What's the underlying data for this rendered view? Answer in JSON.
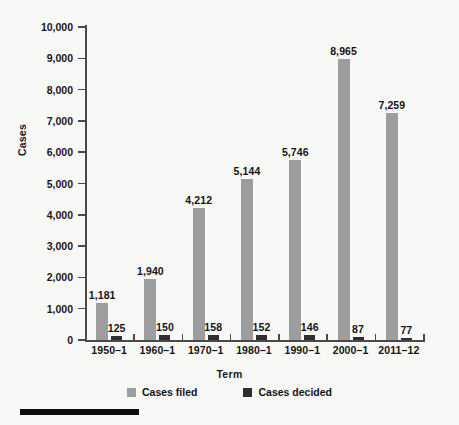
{
  "chart_data": {
    "type": "bar",
    "title": "",
    "xlabel": "Term",
    "ylabel": "Cases",
    "ylim": [
      0,
      10000
    ],
    "ytick_labels": [
      "10,000",
      "9,000",
      "8,000",
      "7,000",
      "6,000",
      "5,000",
      "4,000",
      "3,000",
      "2,000",
      "1,000",
      "0"
    ],
    "ytick_values": [
      10000,
      9000,
      8000,
      7000,
      6000,
      5000,
      4000,
      3000,
      2000,
      1000,
      0
    ],
    "grid": false,
    "legend_position": "bottom-center",
    "categories": [
      "1950–1",
      "1960–1",
      "1970–1",
      "1980–1",
      "1990–1",
      "2000–1",
      "2011–12"
    ],
    "series": [
      {
        "name": "Cases filed",
        "color": "#9d9d9d",
        "values": [
          1181,
          1940,
          4212,
          5144,
          5746,
          8965,
          7259
        ],
        "value_labels": [
          "1,181",
          "1,940",
          "4,212",
          "5,144",
          "5,746",
          "8,965",
          "7,259"
        ]
      },
      {
        "name": "Cases decided",
        "color": "#2e2e30",
        "values": [
          125,
          150,
          158,
          152,
          146,
          87,
          77
        ],
        "value_labels": [
          "125",
          "150",
          "158",
          "152",
          "146",
          "87",
          "77"
        ]
      }
    ]
  },
  "legend": {
    "items": [
      {
        "label": "Cases filed",
        "color": "#9d9d9d"
      },
      {
        "label": "Cases decided",
        "color": "#2e2e30"
      }
    ]
  },
  "axes": {
    "y_title": "Cases",
    "x_title": "Term"
  },
  "figure": {
    "background": "#f8f8f6",
    "axis_color": "#4a4a4a",
    "text_color": "#141414",
    "rule_color": "#0d0d0d"
  }
}
